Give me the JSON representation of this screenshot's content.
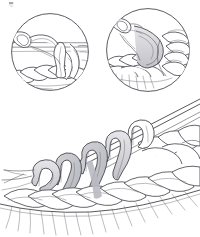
{
  "figure": {
    "caption": "",
    "medium": "pen-and-ink line drawing with graphite shading",
    "background_color": "#ffffff",
    "line_color": "#3a3a40",
    "shade_color": "#d9d9dd",
    "canvas": {
      "width": 200,
      "height": 237
    }
  },
  "artifact": {
    "name": "top-left-speck",
    "label": "",
    "x": 9,
    "y": 2,
    "width": 4,
    "height": 5,
    "color": "#8a8a92"
  },
  "insets": [
    {
      "id": "inset-1",
      "name": "detail-circle-left",
      "label": "",
      "center_x": 50,
      "center_y": 52,
      "radius": 39,
      "depicts": "hook drawing yarn through loop over horizontal strand",
      "contents": [
        "crochet hook tip",
        "working yarn strand",
        "horizontal guide strands",
        "vertical loop of chain",
        "row of completed stitches"
      ]
    },
    {
      "id": "inset-2",
      "name": "detail-circle-right",
      "label": "",
      "center_x": 148,
      "center_y": 50,
      "radius": 42,
      "depicts": "hook pulled through with yarn over, stitches fanned right",
      "contents": [
        "crochet hook tip",
        "curved yarn loop",
        "braided stitch row",
        "fringe of loop legs",
        "cluster of stitches at right"
      ]
    }
  ],
  "main_illustration": {
    "id": "main-view",
    "name": "main-stitch-diagram",
    "label": "",
    "needle": {
      "name": "knitting-needle",
      "label": "",
      "angle_degrees": -22,
      "shafts": 2
    },
    "loops_on_needle": [
      {
        "name": "loop-1",
        "shaded": true
      },
      {
        "name": "loop-2",
        "shaded": true
      },
      {
        "name": "loop-3",
        "shaded": true
      },
      {
        "name": "loop-4",
        "shaded": false
      },
      {
        "name": "loop-5",
        "shaded": false
      }
    ],
    "stitch_rows": [
      {
        "name": "upper-stitch-row",
        "count": 7
      },
      {
        "name": "lower-stitch-row",
        "count": 8
      },
      {
        "name": "fringe-row",
        "count": 12
      }
    ]
  }
}
